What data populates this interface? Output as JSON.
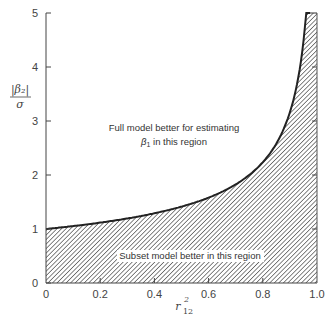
{
  "chart_data": {
    "type": "area",
    "title": "",
    "xlabel": "r²₁₂",
    "xlabel_main": "r",
    "xlabel_sup": "2",
    "xlabel_sub": "12",
    "ylabel_num": "|β₂|",
    "ylabel_den": "σ",
    "xlim": [
      0,
      1.0
    ],
    "ylim": [
      0,
      5
    ],
    "xticks": [
      "0",
      "0.2",
      "0.4",
      "0.6",
      "0.8",
      "1.0"
    ],
    "yticks": [
      "0",
      "1",
      "2",
      "3",
      "4",
      "5"
    ],
    "grid": false,
    "legend": null,
    "series": [
      {
        "name": "boundary |β₂|/σ = 1/√(1 − r²₁₂)",
        "x": [
          0,
          0.1,
          0.2,
          0.3,
          0.4,
          0.5,
          0.6,
          0.7,
          0.75,
          0.8,
          0.85,
          0.9,
          0.92,
          0.94,
          0.96
        ],
        "y": [
          1.0,
          1.05,
          1.12,
          1.2,
          1.29,
          1.41,
          1.58,
          1.83,
          2.0,
          2.24,
          2.58,
          3.16,
          3.54,
          4.08,
          5.0
        ]
      }
    ],
    "annotations": [
      "Full model better for estimating β₁ in this region",
      "Subset model better in this region"
    ],
    "shaded_region": "below curve (hatched)"
  },
  "labels": {
    "upper_region_line1": "Full model better for estimating",
    "upper_region_line2_beta": "β",
    "upper_region_line2_sub": "1",
    "upper_region_line2_rest": " in this region",
    "lower_region": "Subset model better in this region"
  }
}
